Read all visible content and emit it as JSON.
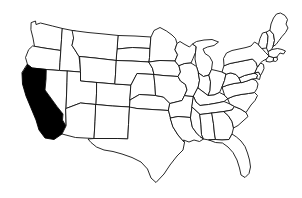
{
  "map": {
    "title": "United States Map",
    "description": "Outline map of the contiguous United States with one state highlighted",
    "background_color": "#ffffff",
    "outline_color": "#111111",
    "default_state_fill": "#ffffff",
    "highlight_fill": "#000000",
    "stroke_width": 0.9,
    "highlighted_states": [
      "California"
    ],
    "viewbox": "0 0 302 198",
    "width": 302,
    "height": 198,
    "states": [
      {
        "code": "WA",
        "name": "Washington",
        "highlighted": false,
        "path": "M31.5,22.5 L35.5,21.0 L36.0,24.5 L40.5,23.0 L52.5,26.0 L62.5,28.5 L61.5,40.0 L60.8,50.5 L44.0,48.0 L34.5,46.5 L33.0,38.0 L31.0,30.0 Z"
      },
      {
        "code": "OR",
        "name": "Oregon",
        "highlighted": false,
        "path": "M33.0,46.0 L44.0,48.0 L60.8,50.5 L60.0,62.5 L59.5,70.5 L46.5,69.5 L32.0,68.0 L27.5,64.5 L25.5,57.5 L28.5,50.0 Z"
      },
      {
        "code": "CA",
        "name": "California",
        "highlighted": true,
        "path": "M27.5,64.5 L32.0,68.0 L46.5,69.5 L46.0,79.5 L45.0,90.0 L57.0,106.5 L63.0,114.0 L62.5,120.0 L66.0,126.0 L62.0,134.0 L54.0,139.5 L45.0,138.0 L39.0,130.0 L36.0,120.0 L31.0,108.0 L26.0,96.0 L22.5,84.0 L22.0,73.0 Z"
      },
      {
        "code": "ID",
        "name": "Idaho",
        "highlighted": false,
        "path": "M62.5,28.5 L72.5,30.5 L75.5,31.0 L73.5,38.5 L72.0,45.5 L75.0,50.0 L79.0,56.5 L80.0,64.5 L80.5,72.0 L67.5,71.0 L59.5,70.5 L60.0,62.5 L60.8,50.5 L61.5,40.0 Z"
      },
      {
        "code": "NV",
        "name": "Nevada",
        "highlighted": false,
        "path": "M46.5,69.5 L59.5,70.5 L67.5,71.0 L67.0,83.0 L66.5,96.0 L66.0,108.5 L66.0,126.0 L62.5,120.0 L63.0,114.0 L57.0,106.5 L45.0,90.0 L46.0,79.5 Z"
      },
      {
        "code": "MT",
        "name": "Montana",
        "highlighted": false,
        "path": "M72.5,30.5 L88.0,32.5 L104.0,34.0 L118.5,35.5 L117.5,49.0 L116.5,60.5 L95.0,58.0 L80.0,56.5 L79.0,56.5 L75.0,50.0 L72.0,45.5 L73.5,38.5 Z"
      },
      {
        "code": "WY",
        "name": "Wyoming",
        "highlighted": false,
        "path": "M80.0,56.5 L95.0,58.0 L116.5,60.5 L115.5,74.5 L114.8,84.0 L97.0,82.5 L80.5,81.0 L80.5,72.0 Z"
      },
      {
        "code": "UT",
        "name": "Utah",
        "highlighted": false,
        "path": "M67.5,71.0 L80.5,72.0 L80.5,81.0 L97.0,82.5 L96.5,93.5 L96.0,104.5 L80.5,103.0 L66.0,108.5 L66.5,96.0 L67.0,83.0 Z"
      },
      {
        "code": "AZ",
        "name": "Arizona",
        "highlighted": false,
        "path": "M66.0,108.5 L80.5,103.0 L96.0,104.5 L95.0,122.0 L94.0,138.5 L75.5,137.5 L62.0,134.0 L66.0,126.0 Z"
      },
      {
        "code": "CO",
        "name": "Colorado",
        "highlighted": false,
        "path": "M97.0,82.5 L114.8,84.0 L131.0,85.0 L130.0,100.0 L129.5,107.0 L112.5,106.0 L96.0,104.5 L96.5,93.5 Z"
      },
      {
        "code": "NM",
        "name": "New Mexico",
        "highlighted": false,
        "path": "M96.0,104.5 L112.5,106.0 L129.5,107.0 L128.5,124.5 L127.8,138.5 L117.5,138.5 L108.0,138.5 L94.0,138.5 L95.0,122.0 Z"
      },
      {
        "code": "ND",
        "name": "North Dakota",
        "highlighted": false,
        "path": "M118.5,35.5 L135.0,36.0 L151.0,37.0 L150.0,48.5 L132.5,47.5 L117.5,49.0 Z"
      },
      {
        "code": "SD",
        "name": "South Dakota",
        "highlighted": false,
        "path": "M117.5,49.0 L132.5,47.5 L150.0,48.5 L149.5,57.5 L149.0,62.0 L132.0,61.0 L116.5,60.5 Z"
      },
      {
        "code": "NE",
        "name": "Nebraska",
        "highlighted": false,
        "path": "M116.5,60.5 L132.0,61.0 L149.0,62.0 L152.5,68.5 L154.0,74.5 L137.0,73.5 L131.0,85.0 L114.8,84.0 L115.5,74.5 Z"
      },
      {
        "code": "KS",
        "name": "Kansas",
        "highlighted": false,
        "path": "M131.0,85.0 L137.0,73.5 L154.0,74.5 L155.0,86.0 L155.5,95.5 L139.5,94.5 L130.0,100.0 Z"
      },
      {
        "code": "OK",
        "name": "Oklahoma",
        "highlighted": false,
        "path": "M129.5,107.0 L130.0,100.0 L139.5,94.5 L155.5,95.5 L163.5,97.0 L170.0,103.5 L168.5,110.5 L152.0,109.5 L137.0,108.5 Z"
      },
      {
        "code": "TX",
        "name": "Texas",
        "highlighted": false,
        "path": "M127.8,138.5 L128.5,124.5 L129.5,107.0 L137.0,108.5 L152.0,109.5 L168.5,110.5 L170.5,118.0 L173.0,127.0 L178.0,135.0 L184.5,142.5 L183.0,150.0 L177.0,156.0 L170.0,165.0 L164.0,174.0 L156.0,182.5 L151.0,178.0 L147.5,169.0 L141.0,162.0 L132.0,157.5 L122.0,154.0 L113.0,151.5 L104.0,150.0 L96.5,147.0 L91.0,142.5 L88.0,139.0 L94.0,138.5 L108.0,138.5 L117.5,138.5 Z"
      },
      {
        "code": "MN",
        "name": "Minnesota",
        "highlighted": false,
        "path": "M151.0,37.0 L154.0,30.5 L160.0,27.5 L166.5,31.0 L172.0,35.0 L175.5,38.5 L177.0,43.5 L175.0,49.5 L177.5,55.0 L175.0,61.0 L160.0,60.5 L149.0,62.0 L149.5,57.5 L150.0,48.5 Z"
      },
      {
        "code": "IA",
        "name": "Iowa",
        "highlighted": false,
        "path": "M149.0,62.0 L160.0,60.5 L175.0,61.0 L179.0,66.0 L180.5,72.0 L178.0,76.5 L163.0,75.5 L154.0,74.5 L152.5,68.5 Z"
      },
      {
        "code": "MO",
        "name": "Missouri",
        "highlighted": false,
        "path": "M154.0,74.5 L163.0,75.5 L178.0,76.5 L180.5,81.0 L185.5,84.5 L187.0,90.0 L184.5,95.5 L182.0,100.5 L170.0,103.5 L163.5,97.0 L155.5,95.5 L155.0,86.0 Z"
      },
      {
        "code": "AR",
        "name": "Arkansas",
        "highlighted": false,
        "path": "M170.0,103.5 L182.0,100.5 L184.5,95.5 L193.5,96.5 L192.0,107.0 L190.5,117.5 L178.0,116.5 L170.5,118.0 L168.5,110.5 Z"
      },
      {
        "code": "LA",
        "name": "Louisiana",
        "highlighted": false,
        "path": "M170.5,118.0 L178.0,116.5 L190.5,117.5 L192.5,127.5 L196.5,133.0 L200.0,136.5 L203.5,139.0 L199.5,141.5 L194.0,140.0 L189.0,142.0 L183.5,140.0 L184.5,142.5 L178.0,135.0 L173.0,127.0 Z"
      },
      {
        "code": "WI",
        "name": "Wisconsin",
        "highlighted": false,
        "path": "M175.0,49.5 L177.0,43.5 L180.0,41.5 L184.0,44.0 L189.5,47.0 L192.5,44.0 L196.0,46.5 L195.5,52.5 L193.0,58.5 L191.0,63.0 L185.0,63.5 L179.0,66.0 L175.0,61.0 L177.5,55.0 Z"
      },
      {
        "code": "MI",
        "name": "Michigan",
        "highlighted": false,
        "path": "M196.0,46.5 L192.5,44.0 L196.5,41.5 L204.0,40.0 L212.0,39.5 L218.5,42.0 L214.0,45.5 L207.5,47.0 L203.0,49.0 L205.0,53.5 L209.5,56.5 L212.5,62.0 L211.5,69.5 L209.0,75.0 L203.5,76.5 L198.5,73.0 L196.5,66.5 L195.0,59.0 L195.5,52.5 Z"
      },
      {
        "code": "IL",
        "name": "Illinois",
        "highlighted": false,
        "path": "M185.0,63.5 L191.0,63.0 L196.5,66.5 L198.5,73.0 L199.5,80.5 L198.0,88.0 L193.5,96.5 L184.5,95.5 L187.0,90.0 L185.5,84.5 L180.5,81.0 L178.0,76.5 L180.5,72.0 L179.0,66.0 Z"
      },
      {
        "code": "IN",
        "name": "Indiana",
        "highlighted": false,
        "path": "M198.5,73.0 L203.5,76.5 L209.0,75.0 L210.5,82.0 L210.0,90.5 L208.0,95.5 L198.0,88.0 L199.5,80.5 Z"
      },
      {
        "code": "OH",
        "name": "Ohio",
        "highlighted": false,
        "path": "M209.0,75.0 L211.5,69.5 L216.0,70.5 L222.0,72.0 L226.0,74.0 L224.5,80.5 L222.0,87.0 L219.5,92.5 L214.0,95.0 L208.0,95.5 L210.0,90.5 L210.5,82.0 Z"
      },
      {
        "code": "KY",
        "name": "Kentucky",
        "highlighted": false,
        "path": "M198.0,88.0 L208.0,95.5 L214.0,95.0 L219.5,92.5 L224.5,95.0 L228.0,98.5 L224.0,101.5 L217.0,103.0 L208.5,104.5 L200.0,105.5 L196.0,102.0 L193.5,96.5 Z"
      },
      {
        "code": "TN",
        "name": "Tennessee",
        "highlighted": false,
        "path": "M193.5,96.5 L196.0,102.0 L200.0,105.5 L208.5,104.5 L217.0,103.0 L224.0,101.5 L230.0,104.0 L234.5,106.5 L232.0,110.0 L224.0,111.5 L212.0,113.0 L200.0,114.5 L192.0,107.0 Z"
      },
      {
        "code": "MS",
        "name": "Mississippi",
        "highlighted": false,
        "path": "M190.5,117.5 L192.0,107.0 L200.0,114.5 L201.0,125.0 L201.5,134.5 L203.5,139.0 L200.0,136.5 L196.5,133.0 L192.5,127.5 Z"
      },
      {
        "code": "AL",
        "name": "Alabama",
        "highlighted": false,
        "path": "M200.0,114.5 L212.0,113.0 L213.5,124.0 L214.5,134.0 L215.5,139.5 L209.0,140.0 L203.5,139.0 L201.5,134.5 L201.0,125.0 Z"
      },
      {
        "code": "GA",
        "name": "Georgia",
        "highlighted": false,
        "path": "M212.0,113.0 L224.0,111.5 L228.5,116.0 L232.0,121.5 L233.5,128.0 L232.0,134.0 L229.0,139.5 L222.0,140.0 L215.5,139.5 L214.5,134.0 L213.5,124.0 Z"
      },
      {
        "code": "FL",
        "name": "Florida",
        "highlighted": false,
        "path": "M215.5,139.5 L222.0,140.0 L229.0,139.5 L232.0,134.0 L236.5,137.0 L241.0,141.0 L245.0,146.5 L247.5,153.0 L249.5,160.0 L250.5,167.0 L249.0,173.5 L245.0,177.5 L241.0,175.0 L239.5,168.0 L237.0,160.0 L233.0,152.5 L228.0,147.0 L222.5,143.0 L215.5,142.5 L209.0,140.0 Z"
      },
      {
        "code": "SC",
        "name": "South Carolina",
        "highlighted": false,
        "path": "M224.0,111.5 L232.0,110.0 L234.5,106.5 L240.5,109.0 L246.0,112.5 L248.0,116.5 L243.0,121.0 L238.0,125.5 L233.5,128.0 L232.0,121.5 L228.5,116.0 Z"
      },
      {
        "code": "NC",
        "name": "North Carolina",
        "highlighted": false,
        "path": "M228.0,98.5 L234.0,96.0 L241.0,94.5 L248.5,93.5 L254.5,92.5 L257.5,95.5 L255.0,100.5 L251.0,105.0 L246.0,112.5 L240.5,109.0 L234.5,106.5 L230.0,104.0 Z"
      },
      {
        "code": "VA",
        "name": "Virginia",
        "highlighted": false,
        "path": "M224.5,95.0 L222.0,87.0 L228.0,85.0 L234.0,83.5 L241.0,82.5 L247.0,81.0 L252.0,79.0 L256.0,80.5 L258.0,84.0 L257.0,88.5 L254.5,92.5 L248.5,93.5 L241.0,94.5 L234.0,96.0 L228.0,98.5 Z"
      },
      {
        "code": "WV",
        "name": "West Virginia",
        "highlighted": false,
        "path": "M222.0,87.0 L224.5,80.5 L226.0,74.0 L231.0,73.0 L236.0,74.5 L239.0,78.0 L241.0,82.5 L234.0,83.5 L228.0,85.0 Z"
      },
      {
        "code": "MD",
        "name": "Maryland",
        "highlighted": false,
        "path": "M241.0,82.5 L239.0,78.0 L244.5,75.5 L250.5,74.0 L255.0,73.0 L257.5,75.5 L256.5,78.5 L252.0,79.0 L247.0,81.0 Z"
      },
      {
        "code": "DE",
        "name": "Delaware",
        "highlighted": false,
        "path": "M255.0,73.0 L258.5,72.0 L260.5,75.5 L259.5,79.5 L256.5,78.5 L257.5,75.5 Z"
      },
      {
        "code": "PA",
        "name": "Pennsylvania",
        "highlighted": false,
        "path": "M226.0,74.0 L222.0,72.0 L224.0,65.5 L230.0,63.5 L237.5,62.0 L245.0,60.5 L252.5,59.0 L256.0,62.5 L257.5,67.0 L255.0,73.0 L250.5,74.0 L244.5,75.5 L239.0,78.0 L236.0,74.5 L231.0,73.0 Z"
      },
      {
        "code": "NJ",
        "name": "New Jersey",
        "highlighted": false,
        "path": "M257.5,67.0 L260.5,63.0 L263.5,64.5 L264.0,68.5 L262.5,72.0 L260.5,75.5 L258.5,72.0 L255.0,73.0 Z"
      },
      {
        "code": "NY",
        "name": "New York",
        "highlighted": false,
        "path": "M224.0,65.5 L223.5,58.5 L226.5,53.0 L232.0,50.5 L239.0,49.0 L246.0,47.5 L251.0,46.0 L254.5,42.0 L258.5,44.5 L262.0,48.5 L265.5,52.5 L269.0,56.0 L266.5,59.0 L262.5,61.0 L260.5,63.0 L257.5,67.0 L256.0,62.5 L252.5,59.0 L245.0,60.5 L237.5,62.0 L230.0,63.5 Z"
      },
      {
        "code": "CT",
        "name": "Connecticut",
        "highlighted": false,
        "path": "M266.5,59.0 L269.0,56.0 L274.0,57.5 L273.5,61.0 L270.0,62.0 L266.5,61.5 Z"
      },
      {
        "code": "RI",
        "name": "Rhode Island",
        "highlighted": false,
        "path": "M274.0,57.5 L277.0,57.0 L277.5,60.0 L275.5,61.5 L273.5,61.0 Z"
      },
      {
        "code": "MA",
        "name": "Massachusetts",
        "highlighted": false,
        "path": "M269.0,56.0 L268.0,51.5 L272.0,49.5 L277.5,48.5 L282.0,49.5 L285.5,51.0 L283.5,54.0 L280.0,53.0 L278.0,55.5 L277.0,57.0 L274.0,57.5 Z"
      },
      {
        "code": "VT",
        "name": "Vermont",
        "highlighted": false,
        "path": "M258.5,44.5 L260.0,38.5 L262.5,33.0 L266.5,32.0 L268.0,36.5 L267.5,42.5 L266.5,48.0 L262.0,48.5 Z"
      },
      {
        "code": "NH",
        "name": "New Hampshire",
        "highlighted": false,
        "path": "M266.5,32.0 L270.0,30.0 L273.5,34.5 L274.5,40.5 L273.0,46.5 L271.5,49.5 L268.0,51.5 L266.5,48.0 L267.5,42.5 L268.0,36.5 Z"
      },
      {
        "code": "ME",
        "name": "Maine",
        "highlighted": false,
        "path": "M270.0,30.0 L271.0,24.0 L273.5,18.0 L276.5,14.0 L280.5,13.0 L285.0,15.5 L287.5,19.5 L286.0,24.0 L288.0,28.0 L285.5,32.5 L282.0,36.5 L279.0,40.5 L276.0,44.5 L273.0,46.5 L274.5,40.5 L273.5,34.5 Z"
      }
    ]
  }
}
